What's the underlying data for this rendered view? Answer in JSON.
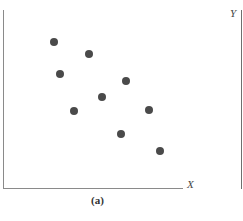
{
  "chart_data": {
    "type": "scatter",
    "title": "",
    "caption": "(a)",
    "xlabel": "X",
    "ylabel": "Y",
    "grid": false,
    "legend": null,
    "axis_ticks": "none",
    "xlim": [
      0,
      180
    ],
    "ylim": [
      0,
      178
    ],
    "points": [
      {
        "x": 51,
        "y": 146
      },
      {
        "x": 86,
        "y": 134
      },
      {
        "x": 57,
        "y": 114
      },
      {
        "x": 123,
        "y": 107
      },
      {
        "x": 99,
        "y": 91
      },
      {
        "x": 71,
        "y": 77
      },
      {
        "x": 146,
        "y": 78
      },
      {
        "x": 118,
        "y": 54
      },
      {
        "x": 157,
        "y": 37
      }
    ],
    "pixel_points": [
      {
        "left": 54,
        "top": 42
      },
      {
        "left": 89,
        "top": 54
      },
      {
        "left": 60,
        "top": 74
      },
      {
        "left": 126,
        "top": 81
      },
      {
        "left": 102,
        "top": 97
      },
      {
        "left": 74,
        "top": 111
      },
      {
        "left": 149,
        "top": 110
      },
      {
        "left": 121,
        "top": 134
      },
      {
        "left": 160,
        "top": 151
      }
    ],
    "trend": "negative correlation"
  },
  "labels": {
    "x_axis": "X",
    "y_axis": "Y",
    "caption": "(a)"
  }
}
